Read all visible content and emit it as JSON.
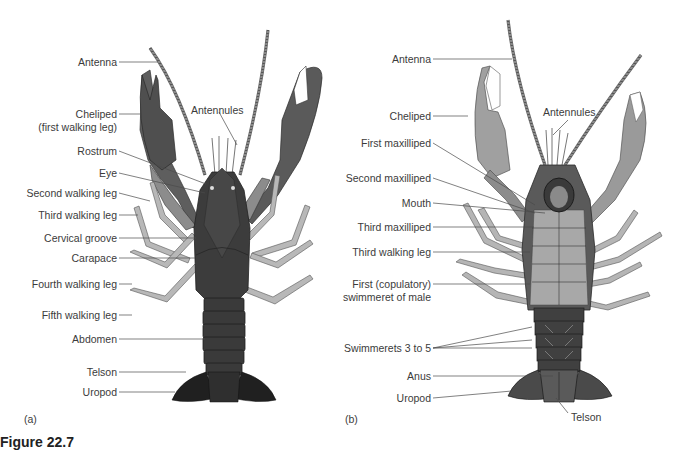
{
  "figure": {
    "title": "Figure 22.7",
    "panels": [
      {
        "tag": "(a)",
        "view": "dorsal",
        "labels": [
          {
            "text": "Antenna"
          },
          {
            "text": "Cheliped"
          },
          {
            "text": "(first walking leg)"
          },
          {
            "text": "Rostrum"
          },
          {
            "text": "Eye"
          },
          {
            "text": "Second walking leg"
          },
          {
            "text": "Third walking leg"
          },
          {
            "text": "Cervical groove"
          },
          {
            "text": "Carapace"
          },
          {
            "text": "Fourth walking leg"
          },
          {
            "text": "Fifth walking leg"
          },
          {
            "text": "Abdomen"
          },
          {
            "text": "Telson"
          },
          {
            "text": "Uropod"
          },
          {
            "text": "Antennules"
          }
        ]
      },
      {
        "tag": "(b)",
        "view": "ventral",
        "labels": [
          {
            "text": "Antenna"
          },
          {
            "text": "Cheliped"
          },
          {
            "text": "First maxilliped"
          },
          {
            "text": "Second maxilliped"
          },
          {
            "text": "Mouth"
          },
          {
            "text": "Third maxilliped"
          },
          {
            "text": "Third walking leg"
          },
          {
            "text": "First (copulatory)"
          },
          {
            "text": "swimmeret of male"
          },
          {
            "text": "Swimmerets 3 to 5"
          },
          {
            "text": "Anus"
          },
          {
            "text": "Uropod"
          },
          {
            "text": "Antennules"
          },
          {
            "text": "Telson"
          }
        ]
      }
    ]
  },
  "colors": {
    "background": "#ffffff",
    "label_text": "#3b3b3b",
    "leader_line": "#4a4a4a",
    "body_dark": "#3a3a3a",
    "claw_dark": "#5a5a5a",
    "claw_light": "#8f8f8f",
    "leg_light": "#b5b5b5",
    "underside": "#a8a8a8"
  }
}
